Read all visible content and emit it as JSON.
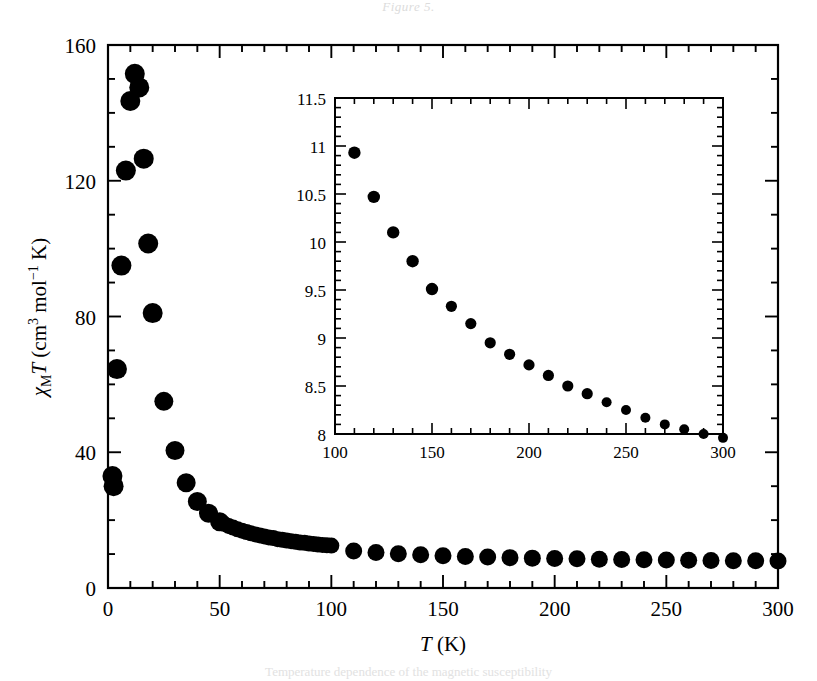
{
  "figure": {
    "top_caption": "Figure 5.",
    "bottom_caption": "Temperature dependence of the magnetic susceptibility"
  },
  "chart_data": [
    {
      "id": "main",
      "type": "scatter",
      "title": "",
      "xlabel": "T (K)",
      "ylabel": "χMT (cm3 mol−1 K)",
      "ylabel_parts": {
        "chi": "χ",
        "sub": "M",
        "t": "T",
        "open": " (cm",
        "sup1": "3",
        "mid": " mol",
        "sup2": "−1",
        "close": " K)"
      },
      "xlim": [
        0,
        300
      ],
      "ylim": [
        0,
        160
      ],
      "xticks": [
        0,
        50,
        100,
        150,
        200,
        250,
        300
      ],
      "yticks": [
        0,
        40,
        80,
        120,
        160
      ],
      "x_minor_step": 10,
      "y_minor_step": 10,
      "grid": false,
      "legend": false,
      "marker": "filled-circle",
      "marker_color": "#000000",
      "x": [
        2,
        2.5,
        4,
        6,
        8,
        10,
        12,
        14,
        16,
        18,
        20,
        25,
        30,
        35,
        40,
        45,
        50,
        52,
        54,
        56,
        58,
        60,
        62,
        64,
        66,
        68,
        70,
        72,
        74,
        76,
        78,
        80,
        82,
        84,
        86,
        88,
        90,
        92,
        94,
        96,
        98,
        100,
        110,
        120,
        130,
        140,
        150,
        160,
        170,
        180,
        190,
        200,
        210,
        220,
        230,
        240,
        250,
        260,
        270,
        280,
        290,
        300
      ],
      "y": [
        33.0,
        30.0,
        64.5,
        95.0,
        123.0,
        143.5,
        151.5,
        147.5,
        126.5,
        101.5,
        81.0,
        55.0,
        40.5,
        31.0,
        25.5,
        22.0,
        19.5,
        18.9,
        18.3,
        17.8,
        17.3,
        16.9,
        16.5,
        16.1,
        15.8,
        15.5,
        15.2,
        14.9,
        14.7,
        14.4,
        14.2,
        14.0,
        13.8,
        13.6,
        13.4,
        13.3,
        13.1,
        13.0,
        12.8,
        12.7,
        12.6,
        12.5,
        10.9,
        10.45,
        10.1,
        9.8,
        9.5,
        9.3,
        9.15,
        8.95,
        8.8,
        8.7,
        8.6,
        8.5,
        8.4,
        8.33,
        8.25,
        8.17,
        8.1,
        8.05,
        8.0,
        7.95
      ]
    },
    {
      "id": "inset",
      "type": "scatter",
      "title": "",
      "xlabel": "",
      "ylabel": "",
      "xlim": [
        100,
        300
      ],
      "ylim": [
        8,
        11.5
      ],
      "xticks": [
        100,
        150,
        200,
        250,
        300
      ],
      "yticks": [
        8,
        8.5,
        9,
        9.5,
        10,
        10.5,
        11,
        11.5
      ],
      "ytick_labels": [
        "8",
        "8.5",
        "9",
        "9.5",
        "10",
        "10.5",
        "11",
        "11.5"
      ],
      "x_minor_step": 10,
      "y_minor_step": 0.1,
      "grid": false,
      "legend": false,
      "marker": "filled-circle",
      "marker_color": "#000000",
      "x": [
        110,
        120,
        130,
        140,
        150,
        160,
        170,
        180,
        190,
        200,
        210,
        220,
        230,
        240,
        250,
        260,
        270,
        280,
        290,
        300
      ],
      "y": [
        10.93,
        10.47,
        10.1,
        9.8,
        9.51,
        9.33,
        9.15,
        8.95,
        8.83,
        8.72,
        8.61,
        8.5,
        8.42,
        8.33,
        8.25,
        8.17,
        8.1,
        8.05,
        8.0,
        7.96
      ]
    }
  ]
}
